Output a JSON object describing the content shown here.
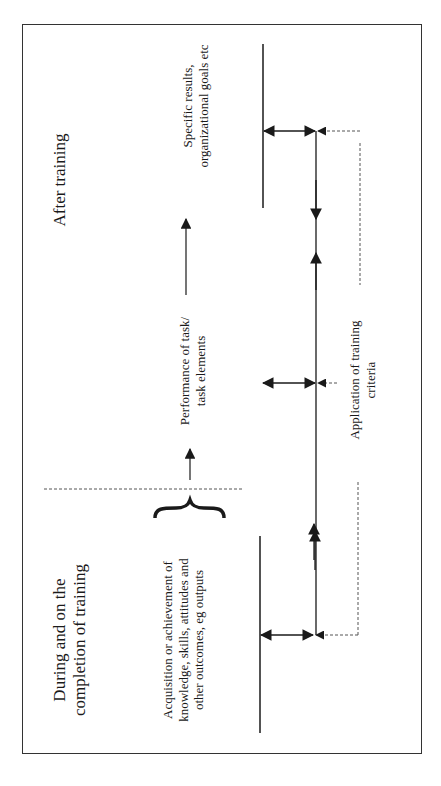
{
  "diagram": {
    "phases": {
      "after": "After training",
      "during_line1": "During and on the",
      "during_line2": "completion of training"
    },
    "levels": {
      "results_line1": "Specific results,",
      "results_line2": "organizational goals etc",
      "performance_line1": "Performance of task/",
      "performance_line2": "task elements",
      "acquisition_line1": "Acquisition or achievement of",
      "acquisition_line2": "knowledge, skills, attitudes and",
      "acquisition_line3": "other outcomes, eg outputs"
    },
    "criteria": {
      "line1": "Application of training",
      "line2": "criteria"
    },
    "colors": {
      "line": "#1a1a1a",
      "border": "#333333",
      "dashed": "#555555"
    }
  }
}
